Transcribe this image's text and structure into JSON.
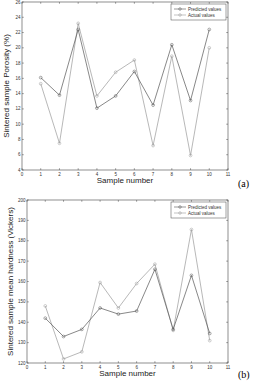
{
  "chart_data": [
    {
      "type": "line",
      "panel_label": "(a)",
      "title": "",
      "xlabel": "Sample number",
      "ylabel": "Sintered sample Porosity (%)",
      "xlim": [
        0,
        11
      ],
      "ylim": [
        4,
        26
      ],
      "xticks": [
        0,
        1,
        2,
        3,
        4,
        5,
        6,
        7,
        8,
        9,
        10,
        11
      ],
      "yticks": [
        4,
        6,
        8,
        10,
        12,
        14,
        16,
        18,
        20,
        22,
        24,
        26
      ],
      "grid": false,
      "legend_position": "upper right",
      "x": [
        1,
        2,
        3,
        4,
        5,
        6,
        7,
        8,
        9,
        10
      ],
      "series": [
        {
          "name": "Predicted values",
          "color": "#555555",
          "marker": "o",
          "values": [
            16.1,
            13.8,
            22.4,
            12.1,
            13.7,
            16.9,
            12.5,
            20.4,
            13.1,
            22.4
          ]
        },
        {
          "name": "Actual values",
          "color": "#9a9a9a",
          "marker": "o",
          "values": [
            15.3,
            7.5,
            23.2,
            13.7,
            16.8,
            18.4,
            7.2,
            18.9,
            5.9,
            20.0
          ]
        }
      ]
    },
    {
      "type": "line",
      "panel_label": "(b)",
      "title": "",
      "xlabel": "Sample number",
      "ylabel": "Sintered sample mean hardness (Vickers)",
      "xlim": [
        0,
        11
      ],
      "ylim": [
        120,
        200
      ],
      "xticks": [
        0,
        1,
        2,
        3,
        4,
        5,
        6,
        7,
        8,
        9,
        10,
        11
      ],
      "yticks": [
        120,
        130,
        140,
        150,
        160,
        170,
        180,
        190,
        200
      ],
      "grid": false,
      "legend_position": "upper right",
      "x": [
        1,
        2,
        3,
        4,
        5,
        6,
        7,
        8,
        9,
        10
      ],
      "series": [
        {
          "name": "Predicted values",
          "color": "#555555",
          "marker": "o",
          "values": [
            142,
            133,
            136.5,
            147,
            144,
            145.5,
            166,
            136.5,
            163,
            134.5
          ]
        },
        {
          "name": "Actual values",
          "color": "#9a9a9a",
          "marker": "o",
          "values": [
            148,
            122,
            125.5,
            159.5,
            147,
            159,
            168.5,
            136,
            185.5,
            131
          ]
        }
      ]
    }
  ]
}
